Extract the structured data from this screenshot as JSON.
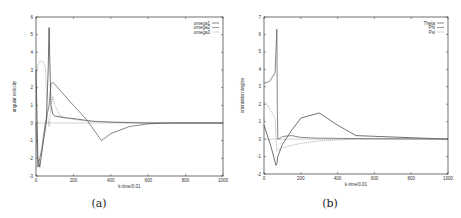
{
  "figures": {
    "a": {
      "caption": "(a)"
    },
    "b": {
      "caption": "(b)"
    }
  },
  "chart_data": [
    {
      "type": "line",
      "title": "",
      "caption": "(a)",
      "xlabel": "k-time/0.01",
      "ylabel": "angular velocity",
      "xlim": [
        0,
        1000
      ],
      "ylim": [
        -3,
        6
      ],
      "xticks": [
        0,
        200,
        400,
        600,
        800,
        1000
      ],
      "yticks": [
        -3,
        -2,
        -1,
        0,
        1,
        2,
        3,
        4,
        5,
        6
      ],
      "grid": false,
      "legend_position": "top-right",
      "series": [
        {
          "name": "omega1",
          "x": [
            0,
            10,
            20,
            40,
            55,
            65,
            70,
            75,
            80,
            90,
            100,
            150,
            200,
            300,
            400,
            500,
            600,
            1000
          ],
          "y": [
            3.0,
            -2.0,
            -2.5,
            -1.0,
            0.0,
            3.0,
            5.4,
            3.0,
            1.0,
            0.5,
            0.4,
            0.3,
            0.25,
            0.1,
            0.05,
            0.02,
            0.0,
            0.0
          ]
        },
        {
          "name": "omega2",
          "x": [
            0,
            10,
            20,
            30,
            50,
            60,
            70,
            80,
            90,
            100,
            150,
            200,
            270,
            350,
            400,
            500,
            600,
            700,
            1000
          ],
          "y": [
            0.0,
            -2.5,
            -2.0,
            -1.5,
            0.0,
            0.5,
            1.0,
            2.2,
            2.3,
            2.2,
            1.6,
            1.0,
            0.2,
            -1.0,
            -0.6,
            -0.2,
            -0.05,
            0.0,
            0.0
          ]
        },
        {
          "name": "omega3",
          "x": [
            0,
            10,
            20,
            35,
            50,
            60,
            70,
            80,
            90,
            100,
            130,
            200,
            300,
            400,
            1000
          ],
          "y": [
            2.5,
            3.3,
            3.5,
            3.5,
            3.2,
            0.5,
            -0.2,
            1.0,
            1.5,
            1.0,
            0.4,
            0.2,
            0.1,
            0.05,
            0.0
          ]
        }
      ]
    },
    {
      "type": "line",
      "title": "",
      "caption": "(b)",
      "xlabel": "k-time/0.01",
      "ylabel": "orientation angles",
      "xlim": [
        0,
        1000
      ],
      "ylim": [
        -2,
        7
      ],
      "xticks": [
        0,
        200,
        400,
        600,
        800,
        1000
      ],
      "yticks": [
        -2,
        -1,
        0,
        1,
        2,
        3,
        4,
        5,
        6,
        7
      ],
      "grid": false,
      "legend_position": "top-right",
      "series": [
        {
          "name": "Theta",
          "x": [
            0,
            40,
            65,
            70,
            75,
            100,
            150,
            200,
            300,
            400,
            500,
            1000
          ],
          "y": [
            0.8,
            -0.5,
            -1.5,
            -1.4,
            -1.0,
            -0.3,
            0.5,
            1.2,
            1.5,
            0.8,
            0.2,
            0.0
          ]
        },
        {
          "name": "Phi",
          "x": [
            0,
            30,
            60,
            70,
            72,
            75,
            80,
            100,
            150,
            200,
            300,
            1000
          ],
          "y": [
            3.2,
            3.3,
            3.8,
            6.3,
            2.0,
            0.0,
            0.0,
            0.15,
            0.2,
            0.1,
            0.05,
            0.0
          ]
        },
        {
          "name": "Psi",
          "x": [
            0,
            10,
            60,
            70,
            80,
            100,
            150,
            200,
            300,
            400,
            500,
            700,
            1000
          ],
          "y": [
            2.1,
            2.1,
            1.2,
            -0.7,
            -0.6,
            -0.5,
            -0.35,
            -0.25,
            -0.1,
            -0.05,
            0.0,
            0.0,
            0.0
          ]
        }
      ]
    }
  ]
}
